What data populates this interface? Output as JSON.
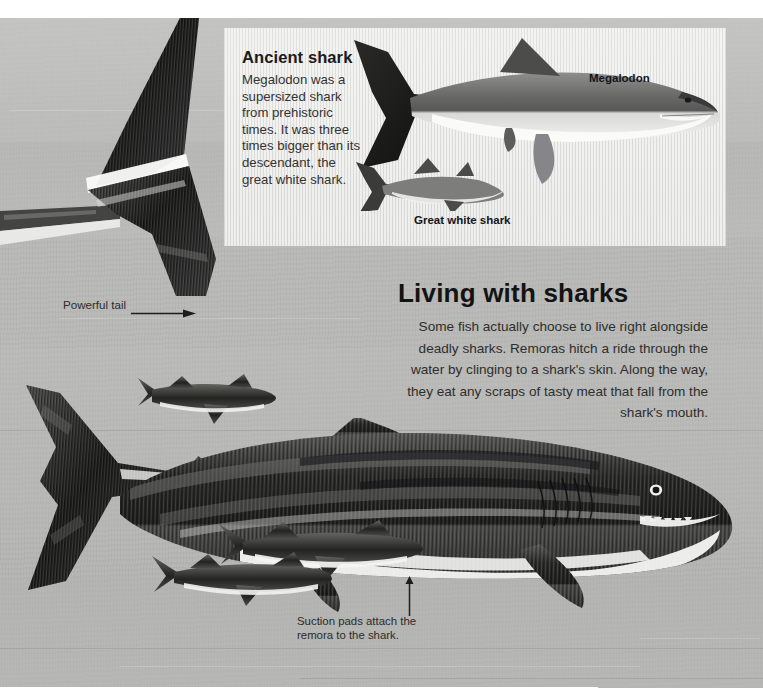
{
  "page": {
    "background_color": "#b9b9b7",
    "inset_background_color": "#e3e3e1"
  },
  "inset": {
    "name": "ancient-shark-inset",
    "heading": "Ancient shark",
    "body": "Megalodon was a supersized shark from prehistoric times. It was three times bigger than its descendant, the great white shark.",
    "labels": [
      {
        "id": "megalodon",
        "text": "Megalodon"
      },
      {
        "id": "great-white-shark",
        "text": "Great white shark"
      }
    ]
  },
  "main": {
    "heading": "Living with sharks",
    "body": "Some fish actually choose to live right alongside deadly sharks. Remoras hitch a ride through the water by clinging to a shark's skin. Along the way, they eat any scraps of tasty meat that fall from the shark's mouth."
  },
  "callouts": [
    {
      "id": "powerful-tail",
      "text": "Powerful tail",
      "arrow": "arrow-right"
    },
    {
      "id": "suction-pads",
      "text": "Suction pads attach the remora to the shark.",
      "arrow": "arrow-up"
    }
  ],
  "illustration": {
    "shark_species": "shark",
    "companion_fish": "remora",
    "remora_count": 3
  }
}
